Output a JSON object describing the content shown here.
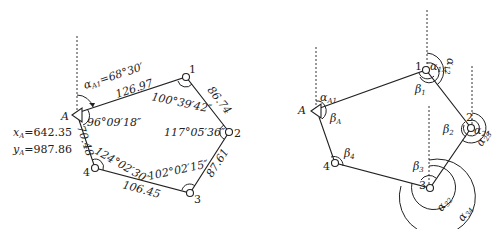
{
  "left_diagram": {
    "points": {
      "A": {
        "label": "A"
      },
      "p1": {
        "label": "1"
      },
      "p2": {
        "label": "2"
      },
      "p3": {
        "label": "3"
      },
      "p4": {
        "label": "4"
      }
    },
    "azimuth_label": "α",
    "azimuth_sub": "A1",
    "azimuth_value": "=68°30′",
    "coord_x_label": "x",
    "coord_x_sub": "A",
    "coord_x_value": "=642.35",
    "coord_y_label": "y",
    "coord_y_sub": "A",
    "coord_y_value": "=987.86",
    "distances": {
      "A1": "126.97",
      "12": "86.74",
      "23": "87.61",
      "34": "106.45",
      "4A": "70.48"
    },
    "angles": {
      "A": "96°09′18″",
      "p1": "100°39′42″",
      "p2": "117°05′36″",
      "p3": "102°02′15″",
      "p4": "124°02′30″"
    }
  },
  "right_diagram": {
    "points": {
      "A": {
        "label": "A"
      },
      "p1": {
        "label": "1"
      },
      "p2": {
        "label": "2"
      },
      "p3": {
        "label": "3"
      },
      "p4": {
        "label": "4"
      }
    },
    "labels": {
      "alpha_A1": {
        "sym": "α",
        "sub": "A1"
      },
      "beta_A": {
        "sym": "β",
        "sub": "A"
      },
      "alpha_1A": {
        "sym": "α",
        "sub": "1A"
      },
      "alpha_12": {
        "sym": "α",
        "sub": "12"
      },
      "beta_1": {
        "sym": "β",
        "sub": "1"
      },
      "alpha_21": {
        "sym": "α",
        "sub": "21"
      },
      "alpha_23": {
        "sym": "α",
        "sub": "23"
      },
      "beta_2": {
        "sym": "β",
        "sub": "2"
      },
      "beta_3": {
        "sym": "β",
        "sub": "3"
      },
      "alpha_32": {
        "sym": "α",
        "sub": "32"
      },
      "alpha_34": {
        "sym": "α",
        "sub": "34"
      },
      "beta_4": {
        "sym": "β",
        "sub": "4"
      }
    }
  }
}
